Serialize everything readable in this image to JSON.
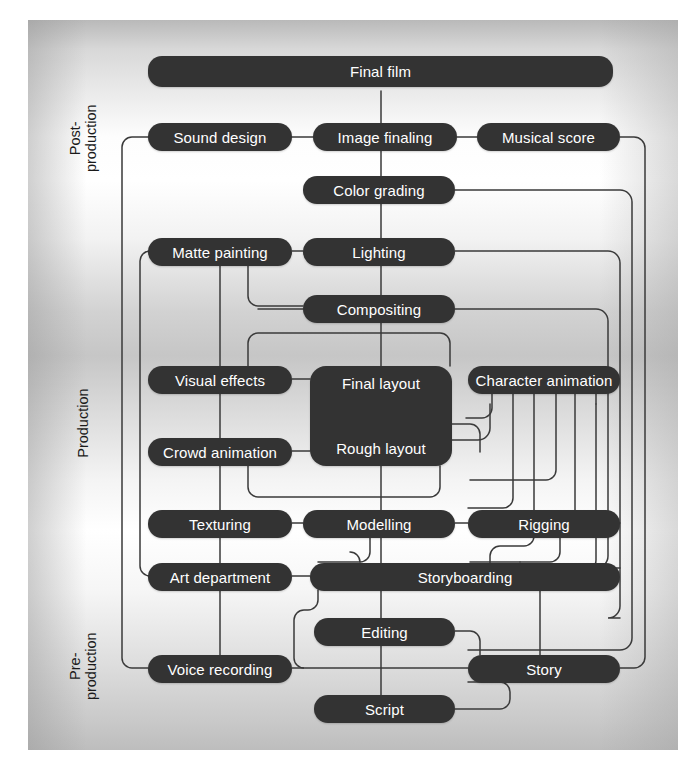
{
  "diagram": {
    "box_color": "#333333",
    "text_color": "#ffffff",
    "line_color": "#3a3a3a",
    "phases": [
      {
        "id": "post",
        "label": "Post-\nproduction"
      },
      {
        "id": "production",
        "label": "Production"
      },
      {
        "id": "pre",
        "label": "Pre-\nproduction"
      }
    ],
    "nodes": [
      {
        "id": "final_film",
        "label": "Final film"
      },
      {
        "id": "sound_design",
        "label": "Sound design"
      },
      {
        "id": "image_finaling",
        "label": "Image finaling"
      },
      {
        "id": "musical_score",
        "label": "Musical score"
      },
      {
        "id": "color_grading",
        "label": "Color grading"
      },
      {
        "id": "matte_painting",
        "label": "Matte painting"
      },
      {
        "id": "lighting",
        "label": "Lighting"
      },
      {
        "id": "compositing",
        "label": "Compositing"
      },
      {
        "id": "visual_effects",
        "label": "Visual effects"
      },
      {
        "id": "final_layout",
        "label": "Final layout"
      },
      {
        "id": "rough_layout",
        "label": "Rough layout"
      },
      {
        "id": "character_animation",
        "label": "Character animation"
      },
      {
        "id": "crowd_animation",
        "label": "Crowd animation"
      },
      {
        "id": "texturing",
        "label": "Texturing"
      },
      {
        "id": "modelling",
        "label": "Modelling"
      },
      {
        "id": "rigging",
        "label": "Rigging"
      },
      {
        "id": "art_department",
        "label": "Art department"
      },
      {
        "id": "storyboarding",
        "label": "Storyboarding"
      },
      {
        "id": "editing",
        "label": "Editing"
      },
      {
        "id": "voice_recording",
        "label": "Voice recording"
      },
      {
        "id": "story",
        "label": "Story"
      },
      {
        "id": "script",
        "label": "Script"
      }
    ]
  }
}
